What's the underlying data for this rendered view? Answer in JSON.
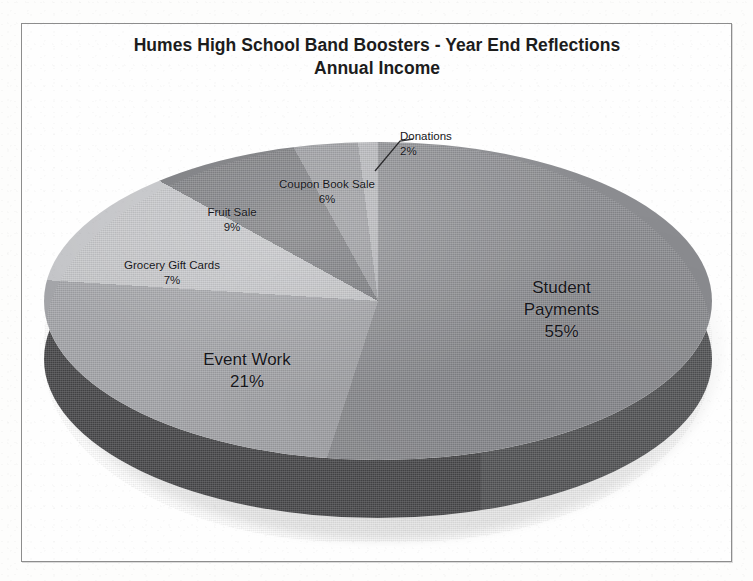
{
  "chart_data": {
    "type": "pie",
    "title": "Humes High School Band Boosters - Year End Reflections",
    "subtitle": "Annual Income",
    "xlabel": "",
    "ylabel": "",
    "legend": "none",
    "data_labels": "category name and percentage, placed inside/outside slices",
    "style": "3D exploded-free pie, grayscale photocopy",
    "units": "percent",
    "total": 100,
    "categories": [
      "Student Payments",
      "Event Work",
      "Grocery Gift Cards",
      "Fruit Sale",
      "Coupon Book Sale",
      "Donations"
    ],
    "values": [
      55,
      21,
      7,
      9,
      6,
      2
    ],
    "slices": [
      {
        "label": "Student Payments",
        "percent": 55,
        "percent_text": "55%",
        "color": "#8b8c90"
      },
      {
        "label": "Event Work",
        "percent": 21,
        "percent_text": "21%",
        "color": "#a2a3a7"
      },
      {
        "label": "Grocery Gift Cards",
        "percent": 7,
        "percent_text": "7%",
        "color": "#c3c4c7"
      },
      {
        "label": "Fruit Sale",
        "percent": 9,
        "percent_text": "9%",
        "color": "#77787c"
      },
      {
        "label": "Coupon Book Sale",
        "percent": 6,
        "percent_text": "6%",
        "color": "#999a9e"
      },
      {
        "label": "Donations",
        "percent": 2,
        "percent_text": "2%",
        "color": "#b5b6ba"
      }
    ]
  },
  "chart": {
    "title_line1": "Humes High School Band Boosters - Year End Reflections",
    "title_line2": "Annual Income",
    "labels": {
      "student_payments": {
        "name_line1": "Student",
        "name_line2": "Payments",
        "percent": "55%"
      },
      "event_work": {
        "name": "Event Work",
        "percent": "21%"
      },
      "grocery_gift": {
        "name": "Grocery Gift Cards",
        "percent": "7%"
      },
      "fruit_sale": {
        "name": "Fruit Sale",
        "percent": "9%"
      },
      "coupon_book": {
        "name": "Coupon Book Sale",
        "percent": "6%"
      },
      "donations": {
        "name": "Donations",
        "percent": "2%"
      }
    }
  },
  "colors": {
    "page_background": "#fdfdfc",
    "frame_border": "#8d8d8d",
    "text": "#16161a",
    "pie_side_wall": "#45464b"
  }
}
